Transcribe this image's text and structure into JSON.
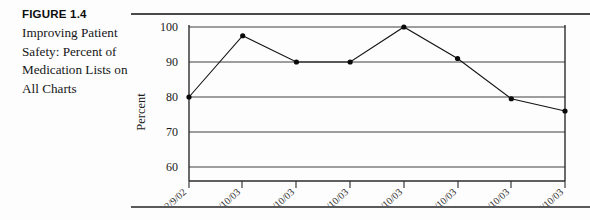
{
  "figure": {
    "number_label": "FIGURE 1.4",
    "title": "Improving Patient Safety: Percent of Medication Lists on All Charts"
  },
  "chart_data": {
    "type": "line",
    "title": "",
    "xlabel": "",
    "ylabel": "Percent",
    "categories": [
      "12/9/02",
      "1/10/03",
      "2/10/03",
      "3/10/03",
      "4/10/03",
      "5/10/03",
      "8/10/03",
      "7/10/03"
    ],
    "values": [
      80,
      97.5,
      90,
      90,
      100,
      91,
      79.5,
      76
    ],
    "ylim": [
      60,
      100
    ],
    "yticks": [
      60,
      70,
      80,
      90,
      100
    ],
    "grid": "horizontal",
    "legend": "none",
    "marker": "filled-circle",
    "line_color": "#141414",
    "marker_color": "#0a0a0a"
  }
}
